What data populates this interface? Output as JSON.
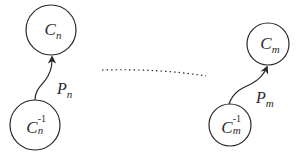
{
  "diagram": {
    "colors": {
      "stroke": "#2a2a2a",
      "background": "#ffffff"
    },
    "nodes": [
      {
        "id": "Cn",
        "base": "C",
        "sub": "n",
        "sup": "",
        "cx": 51,
        "cy": 30,
        "r": 25
      },
      {
        "id": "Cn_inv",
        "base": "C",
        "sub": "n",
        "sup": "-1",
        "cx": 35,
        "cy": 125,
        "r": 25
      },
      {
        "id": "Cm",
        "base": "C",
        "sub": "m",
        "sup": "",
        "cx": 268,
        "cy": 44,
        "r": 21
      },
      {
        "id": "Cm_inv",
        "base": "C",
        "sub": "m",
        "sup": "-1",
        "cx": 230,
        "cy": 125,
        "r": 21
      }
    ],
    "edges": [
      {
        "id": "Pn",
        "from": "Cn_inv",
        "to": "Cn",
        "label_base": "P",
        "label_sub": "n",
        "style": "curved-arrow"
      },
      {
        "id": "Pm",
        "from": "Cm_inv",
        "to": "Cm",
        "label_base": "P",
        "label_sub": "m",
        "style": "curved-arrow"
      }
    ],
    "ellipsis": {
      "style": "dotted",
      "meaning": "continuation between n and m"
    }
  }
}
